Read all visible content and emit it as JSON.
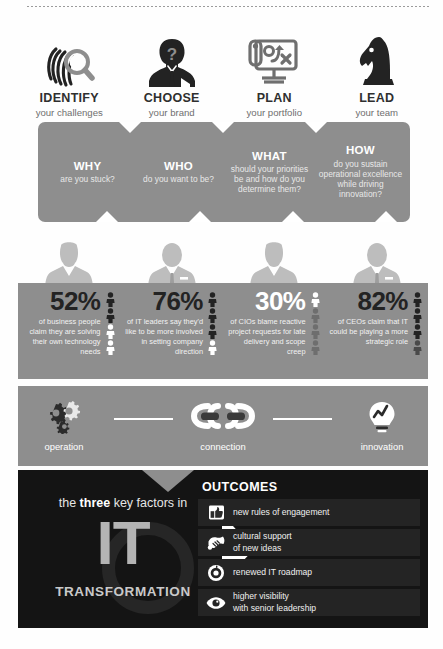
{
  "steps": [
    {
      "icon": "fingerprint-magnifier-icon",
      "title": "IDENTIFY",
      "subtitle": "your challenges"
    },
    {
      "icon": "businessman-question-icon",
      "title": "CHOOSE",
      "subtitle": "your brand"
    },
    {
      "icon": "strategy-board-icon",
      "title": "PLAN",
      "subtitle": "your portfolio"
    },
    {
      "icon": "chess-knight-icon",
      "title": "LEAD",
      "subtitle": "your team"
    }
  ],
  "questions": [
    {
      "head": "WHY",
      "body": "are you stuck?"
    },
    {
      "head": "WHO",
      "body": "do you want to be?"
    },
    {
      "head": "WHAT",
      "body": "should your priorities be and how do you determine them?"
    },
    {
      "head": "HOW",
      "body": "do you sustain operational excellence while driving innovation?"
    }
  ],
  "stats": [
    {
      "percent": "52%",
      "description": "of business people claim they are solving their own technology needs",
      "dark_text": true
    },
    {
      "percent": "76%",
      "description": "of IT leaders say they'd like to be more involved in setting company direction",
      "dark_text": true
    },
    {
      "percent": "30%",
      "description": "of CIOs blame reactive project requests for late delivery and scope creep",
      "dark_text": false
    },
    {
      "percent": "82%",
      "description": "of CEOs claim that IT could be playing a more strategic role",
      "dark_text": true
    }
  ],
  "process": [
    {
      "icon": "gears-icon",
      "label": "operation"
    },
    {
      "icon": "chain-link-icon",
      "label": "connection"
    },
    {
      "icon": "lightbulb-growth-icon",
      "label": "innovation"
    }
  ],
  "transformation": {
    "lead_in_prefix": "the ",
    "lead_in_bold": "three",
    "lead_in_suffix": " key factors in",
    "it_word": "IT",
    "sub_word": "TRANSFORMATION"
  },
  "outcomes": {
    "title": "OUTCOMES",
    "items": [
      {
        "icon": "thumbs-up-box-icon",
        "text": "new rules of engagement"
      },
      {
        "icon": "handshake-icon",
        "text": "cultural support\nof new ideas"
      },
      {
        "icon": "target-radar-icon",
        "text": "renewed IT roadmap"
      },
      {
        "icon": "eye-icon",
        "text": "higher visibility\nwith senior leadership"
      }
    ]
  },
  "colors": {
    "band_gray": "#8e8e8e",
    "dark_panel": "#141414",
    "outcome_row": "#242424",
    "it_letter_gray": "#b4b4b4",
    "page_background": "#fefefe"
  }
}
